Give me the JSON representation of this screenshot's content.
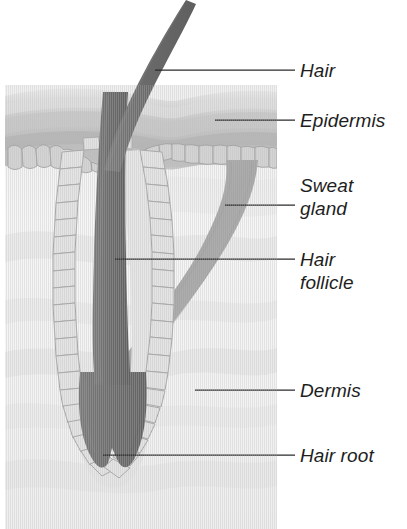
{
  "diagram": {
    "background_color": "#ffffff",
    "canvas": {
      "width": 407,
      "height": 529
    },
    "skin_block": {
      "x": 5,
      "y": 85,
      "width": 272,
      "height": 444,
      "dermis_color": "#f2f2f2",
      "epidermis_color": "#c9c9c9"
    },
    "palette": {
      "hair_dark": "#6e6e6e",
      "hair_root_dark": "#6b6b6b",
      "follicle_cell_fill": "#e2e2e2",
      "follicle_cell_stroke": "#a8a8a8",
      "sweat_gland_fill": "#a9a9a9",
      "epidermis_band_1": "#dcdcdc",
      "epidermis_band_2": "#c2c2c2",
      "epidermis_band_3": "#b6b6b6",
      "dermis_fill": "#f4f4f4",
      "leader_line": "#2a2a2a",
      "label_text": "#1e1e1e"
    }
  },
  "labels": [
    {
      "id": "hair",
      "text": "Hair",
      "lines": [
        "Hair"
      ],
      "text_x": 300,
      "text_y": 77,
      "leader": {
        "x1": 155,
        "y1": 70,
        "x2": 295,
        "y2": 70
      }
    },
    {
      "id": "epidermis",
      "text": "Epidermis",
      "lines": [
        "Epidermis"
      ],
      "text_x": 300,
      "text_y": 127,
      "leader": {
        "x1": 215,
        "y1": 120,
        "x2": 295,
        "y2": 120
      }
    },
    {
      "id": "sweat-gland",
      "text": "Sweat gland",
      "lines": [
        "Sweat",
        "gland"
      ],
      "text_x": 300,
      "text_y": 192,
      "leader": {
        "x1": 225,
        "y1": 205,
        "x2": 295,
        "y2": 205
      }
    },
    {
      "id": "hair-follicle",
      "text": "Hair follicle",
      "lines": [
        "Hair",
        "follicle"
      ],
      "text_x": 300,
      "text_y": 266,
      "leader": {
        "x1": 115,
        "y1": 259,
        "x2": 295,
        "y2": 259
      }
    },
    {
      "id": "dermis",
      "text": "Dermis",
      "lines": [
        "Dermis"
      ],
      "text_x": 300,
      "text_y": 397,
      "leader": {
        "x1": 195,
        "y1": 390,
        "x2": 295,
        "y2": 390
      }
    },
    {
      "id": "hair-root",
      "text": "Hair root",
      "lines": [
        "Hair root"
      ],
      "text_x": 300,
      "text_y": 462,
      "leader": {
        "x1": 103,
        "y1": 455,
        "x2": 295,
        "y2": 455
      }
    }
  ],
  "structures": [
    {
      "id": "hair-shaft",
      "name": "hair shaft",
      "description": "dark gray curved tapering strand rising out of the skin"
    },
    {
      "id": "epidermis-layer",
      "name": "epidermis",
      "description": "banded outer skin layer with scalloped lower border"
    },
    {
      "id": "dermis-layer",
      "name": "dermis",
      "description": "pale textured inner skin layer"
    },
    {
      "id": "hair-follicle-structure",
      "name": "hair follicle",
      "description": "cell-lined sheath surrounding the hair"
    },
    {
      "id": "hair-root-bulb",
      "name": "hair root",
      "description": "dark bulb at the base of the follicle with a notch"
    },
    {
      "id": "sweat-gland-duct",
      "name": "sweat gland",
      "description": "curved gray duct sweeping down and left through the dermis"
    }
  ]
}
